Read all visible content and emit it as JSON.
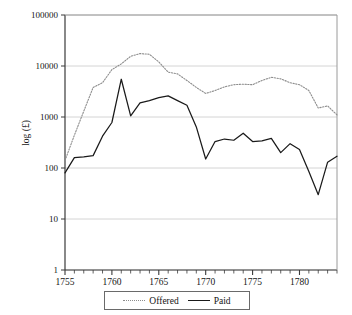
{
  "chart_data": {
    "type": "line",
    "title": "",
    "xlabel": "",
    "ylabel": "log (£)",
    "xlim": [
      1755,
      1784
    ],
    "ylim": [
      1,
      100000
    ],
    "yscale": "log",
    "grid": true,
    "legend_position": "bottom",
    "y_ticks": [
      "1",
      "10",
      "100",
      "1000",
      "10000",
      "100000"
    ],
    "y_tick_values": [
      1,
      10,
      100,
      1000,
      10000,
      100000
    ],
    "x_ticks": [
      "1755",
      "1760",
      "1765",
      "1770",
      "1775",
      "1780"
    ],
    "x_tick_values": [
      1755,
      1760,
      1765,
      1770,
      1775,
      1780
    ],
    "x_minor_tick_step": 1,
    "x": [
      1755,
      1756,
      1757,
      1758,
      1759,
      1760,
      1761,
      1762,
      1763,
      1764,
      1765,
      1766,
      1767,
      1768,
      1769,
      1770,
      1771,
      1772,
      1773,
      1774,
      1775,
      1776,
      1777,
      1778,
      1779,
      1780,
      1781,
      1782,
      1783,
      1784
    ],
    "series": [
      {
        "name": "Offered",
        "style": "dotted",
        "color": "#8c8c8c",
        "values": [
          140,
          440,
          1300,
          3800,
          4700,
          8500,
          11000,
          15500,
          17500,
          17000,
          12000,
          7600,
          7000,
          5200,
          3800,
          2900,
          3300,
          3900,
          4300,
          4400,
          4300,
          5200,
          6000,
          5600,
          4700,
          4300,
          3300,
          1500,
          1650,
          1100
        ]
      },
      {
        "name": "Paid",
        "style": "solid",
        "color": "#1a1a1a",
        "values": [
          80,
          160,
          165,
          175,
          420,
          780,
          5500,
          1050,
          1900,
          2100,
          2400,
          2600,
          2100,
          1700,
          640,
          150,
          330,
          370,
          350,
          480,
          330,
          340,
          380,
          200,
          300,
          230,
          85,
          30,
          130,
          170
        ]
      }
    ],
    "legend": [
      {
        "label": "Offered",
        "style": "dotted",
        "color": "#8c8c8c"
      },
      {
        "label": "Paid",
        "style": "solid",
        "color": "#1a1a1a"
      }
    ]
  }
}
